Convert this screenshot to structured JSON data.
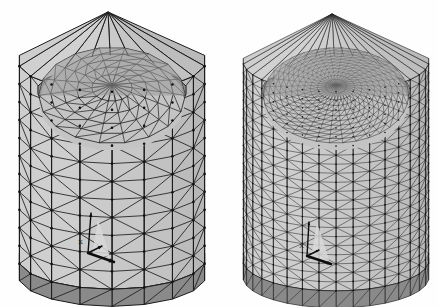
{
  "figure": {
    "background_color": "#fefefe",
    "width": 438,
    "height": 307,
    "panel_count": 2
  },
  "palette": {
    "background": "#fefefe",
    "edge_line": "#1c1c1c",
    "front_face_light": "#c9c9c9",
    "front_face_mid": "#bdbdbd",
    "side_face": "#b0b0b0",
    "interior_dome": "#c4c4c4",
    "interior_shadow": "#9a9a9a",
    "top_rim_dark": "#8e8e8e",
    "bottom_band_dark": "#8a8a8a",
    "node_dot": "#111111",
    "triad_arrow": "#0d0d0d",
    "triad_highlight": "#d8d8d8"
  },
  "panels": [
    {
      "id": "coarse-mesh",
      "name": "Coarse mesh",
      "position": "left",
      "bounds": {
        "x": 18,
        "y": 10,
        "width": 188,
        "height": 290
      },
      "apex": {
        "x": 108,
        "y": 12
      },
      "mesh": {
        "refinement": "coarse",
        "circumferential_divisions": 18,
        "axial_divisions": 11,
        "dome_rings": 5,
        "dome_sectors": 18,
        "approx_triangles": 520,
        "edge_width": 1.0,
        "node_radius": 1.3,
        "show_nodes": true
      },
      "triad": {
        "origin": {
          "x": 88,
          "y": 253
        },
        "label": "X",
        "label_pos": {
          "x": 78,
          "y": 244
        },
        "arrows": [
          {
            "axis": "x",
            "dx": 26,
            "dy": 9,
            "head": 5
          },
          {
            "axis": "y",
            "dx": 14,
            "dy": -7,
            "head": 4
          },
          {
            "axis": "z",
            "dx": 3,
            "dy": -40,
            "head": 4
          }
        ]
      }
    },
    {
      "id": "fine-mesh",
      "name": "Refined mesh",
      "position": "right",
      "bounds": {
        "x": 243,
        "y": 10,
        "width": 186,
        "height": 292
      },
      "apex": {
        "x": 332,
        "y": 14
      },
      "mesh": {
        "refinement": "fine",
        "circumferential_divisions": 34,
        "axial_divisions": 22,
        "dome_rings": 11,
        "dome_sectors": 34,
        "approx_triangles": 2300,
        "edge_width": 0.6,
        "node_radius": 0.8,
        "show_nodes": true
      },
      "triad": {
        "origin": {
          "x": 307,
          "y": 256
        },
        "label": "X",
        "label_pos": {
          "x": 299,
          "y": 248
        },
        "arrows": [
          {
            "axis": "x",
            "dx": 24,
            "dy": 8,
            "head": 4
          },
          {
            "axis": "y",
            "dx": 12,
            "dy": -6,
            "head": 3
          },
          {
            "axis": "z",
            "dx": 2,
            "dy": -34,
            "head": 3
          }
        ]
      }
    }
  ],
  "geometry": {
    "description": "Open-topped cylindrical canister shown in perspective from slightly above; faceted outer wall, recessed domed inner floor visible through the open top, dark shaded rim and base band.",
    "body_shape": "cylinder",
    "top_state": "open",
    "view": "three-quarter from above"
  }
}
